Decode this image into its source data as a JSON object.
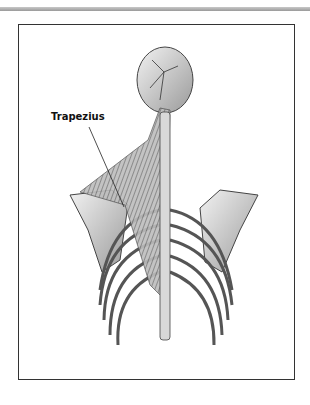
{
  "figure": {
    "labels": [
      {
        "text": "Trapezius",
        "target": "trapezius-muscle"
      }
    ],
    "colors": {
      "frame_border": "#333333",
      "top_bar": "#a8a8a8",
      "bone": "#e6e6e6",
      "bone_shade": "#8c8c8c",
      "muscle": "#6e6e6e"
    }
  }
}
